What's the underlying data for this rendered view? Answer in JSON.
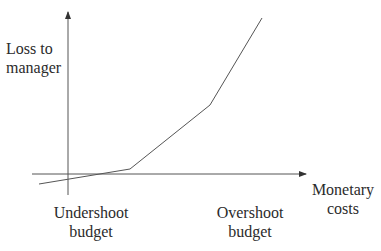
{
  "diagram": {
    "title_fragment": "",
    "y_axis": {
      "label_lines": [
        "Loss to",
        "manager"
      ]
    },
    "x_axis": {
      "label_lines": [
        "Monetary",
        "costs"
      ]
    },
    "markers": [
      {
        "label_lines": [
          "Undershoot",
          "budget"
        ]
      },
      {
        "label_lines": [
          "Overshoot",
          "budget"
        ]
      }
    ],
    "colors": {
      "axis": "#555555",
      "curve": "#555555",
      "text": "#2b2b2b"
    },
    "curve_points": [
      [
        39,
        184
      ],
      [
        130,
        169
      ],
      [
        210,
        105
      ],
      [
        262,
        18
      ]
    ]
  }
}
